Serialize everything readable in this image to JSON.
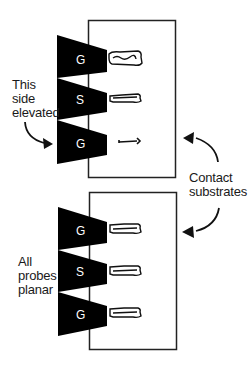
{
  "diagram": {
    "type": "probe-planarity-illustration",
    "colors": {
      "probe": "#000000",
      "line": "#222222",
      "text": "#1a1a1a",
      "background": "#ffffff"
    },
    "top_panel": {
      "probes": [
        {
          "label": "G",
          "contact": "full"
        },
        {
          "label": "S",
          "contact": "full"
        },
        {
          "label": "G",
          "contact": "faint"
        }
      ],
      "annotation": [
        "This",
        "side",
        "elevated"
      ]
    },
    "bottom_panel": {
      "probes": [
        {
          "label": "G",
          "contact": "full"
        },
        {
          "label": "S",
          "contact": "full"
        },
        {
          "label": "G",
          "contact": "full"
        }
      ],
      "annotation": [
        "All",
        "probes",
        "planar"
      ]
    },
    "shared_annotation": [
      "Contact",
      "substrates"
    ]
  }
}
